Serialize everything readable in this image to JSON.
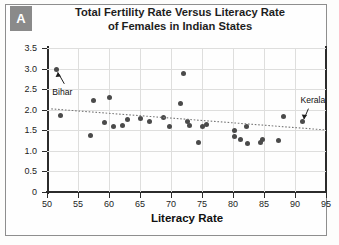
{
  "figure": {
    "panel_letter": "A",
    "title_line1": "Total Fertility Rate Versus Literacy Rate",
    "title_line2": "of Females in Indian States",
    "colors": {
      "badge_background": "#8a8a8a",
      "badge_text": "#ffffff",
      "axis": "#2b2b2b",
      "gridline": "#dededd",
      "marker": "#4a4a4a",
      "trendline": "#777777",
      "frame": "#8e8e8e",
      "background": "#fefefe"
    }
  },
  "chart_data": {
    "type": "scatter",
    "title": "Total Fertility Rate Versus Literacy Rate of Females in Indian States",
    "xlabel": "Literacy Rate",
    "ylabel": "Total Fertility Rate",
    "xlim": [
      50,
      95
    ],
    "ylim": [
      0,
      3.5
    ],
    "xticks": [
      50,
      55,
      60,
      65,
      70,
      75,
      80,
      85,
      90,
      95
    ],
    "yticks": [
      "0",
      "0.5",
      "1.0",
      "1.5",
      "2.0",
      "2.5",
      "3.0",
      "3.5"
    ],
    "ytick_values": [
      0,
      0.5,
      1.0,
      1.5,
      2.0,
      2.5,
      3.0,
      3.5
    ],
    "grid": true,
    "legend": "none",
    "points": [
      {
        "x": 51.5,
        "y": 2.97
      },
      {
        "x": 52.1,
        "y": 1.87
      },
      {
        "x": 57.0,
        "y": 1.38
      },
      {
        "x": 57.5,
        "y": 2.22
      },
      {
        "x": 60.0,
        "y": 2.3
      },
      {
        "x": 59.2,
        "y": 1.68
      },
      {
        "x": 60.8,
        "y": 1.58
      },
      {
        "x": 62.1,
        "y": 1.62
      },
      {
        "x": 63.0,
        "y": 1.77
      },
      {
        "x": 65.0,
        "y": 1.79
      },
      {
        "x": 66.5,
        "y": 1.72
      },
      {
        "x": 68.8,
        "y": 1.8
      },
      {
        "x": 69.8,
        "y": 1.58
      },
      {
        "x": 72.0,
        "y": 2.87
      },
      {
        "x": 71.6,
        "y": 2.14
      },
      {
        "x": 72.6,
        "y": 1.72
      },
      {
        "x": 73.0,
        "y": 1.62
      },
      {
        "x": 75.0,
        "y": 1.58
      },
      {
        "x": 75.8,
        "y": 1.63
      },
      {
        "x": 74.5,
        "y": 1.21
      },
      {
        "x": 80.3,
        "y": 1.5
      },
      {
        "x": 80.3,
        "y": 1.36
      },
      {
        "x": 81.2,
        "y": 1.28
      },
      {
        "x": 82.2,
        "y": 1.6
      },
      {
        "x": 82.3,
        "y": 1.18
      },
      {
        "x": 84.7,
        "y": 1.28
      },
      {
        "x": 84.4,
        "y": 1.2
      },
      {
        "x": 88.1,
        "y": 1.83
      },
      {
        "x": 87.3,
        "y": 1.25
      },
      {
        "x": 91.2,
        "y": 1.71
      }
    ],
    "annotations": [
      {
        "label": "Bihar",
        "x": 51.5,
        "y": 2.97
      },
      {
        "label": "Kerala",
        "x": 91.2,
        "y": 1.71
      }
    ],
    "trendline": {
      "x_start": 50.7,
      "y_start": 2.02,
      "x_end": 94.8,
      "y_end": 1.51,
      "style": "dotted"
    }
  }
}
